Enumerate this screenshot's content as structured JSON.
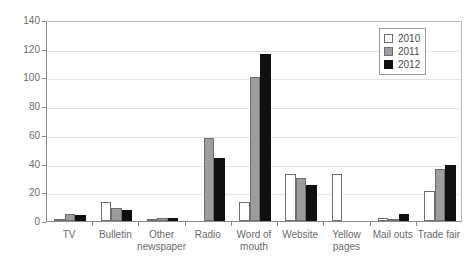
{
  "chart_data": {
    "type": "bar",
    "title": "",
    "xlabel": "",
    "ylabel": "",
    "ylim": [
      0,
      140
    ],
    "ytick_values": [
      0,
      20,
      40,
      60,
      80,
      100,
      120,
      140
    ],
    "ytick_labels": [
      "0",
      "20",
      "40",
      "60",
      "80",
      "100",
      "120",
      "140"
    ],
    "grid": true,
    "grid_axis": "y",
    "legend_position": "top-right",
    "categories": [
      "TV",
      "Bulletin",
      "Other\nnewspaper",
      "Radio",
      "Word of\nmouth",
      "Website",
      "Yellow\npages",
      "Mail outs",
      "Trade fair"
    ],
    "category_lines": [
      [
        "TV"
      ],
      [
        "Bulletin"
      ],
      [
        "Other",
        "newspaper"
      ],
      [
        "Radio"
      ],
      [
        "Word of",
        "mouth"
      ],
      [
        "Website"
      ],
      [
        "Yellow",
        "pages"
      ],
      [
        "Mail outs"
      ],
      [
        "Trade fair"
      ]
    ],
    "series": [
      {
        "name": "2010",
        "color": "#ffffff",
        "values": [
          1,
          13,
          1,
          0,
          13,
          33,
          33,
          2,
          21
        ]
      },
      {
        "name": "2011",
        "color": "#9d9d9d",
        "values": [
          5,
          9,
          2,
          58,
          100,
          30,
          0,
          1,
          36
        ]
      },
      {
        "name": "2012",
        "color": "#101010",
        "values": [
          4,
          8,
          2,
          44,
          116,
          25,
          0,
          5,
          39
        ]
      }
    ]
  },
  "legend": {
    "entries": [
      {
        "label": "2010",
        "series_class": "s2010"
      },
      {
        "label": "2011",
        "series_class": "s2011"
      },
      {
        "label": "2012",
        "series_class": "s2012"
      }
    ]
  },
  "colors": {
    "series_2010": "#ffffff",
    "series_2011": "#9d9d9d",
    "series_2012": "#101010",
    "axis": "#8c8c8c",
    "grid": "#e4e4e4",
    "text": "#6b6b6b",
    "background": "#ffffff"
  }
}
